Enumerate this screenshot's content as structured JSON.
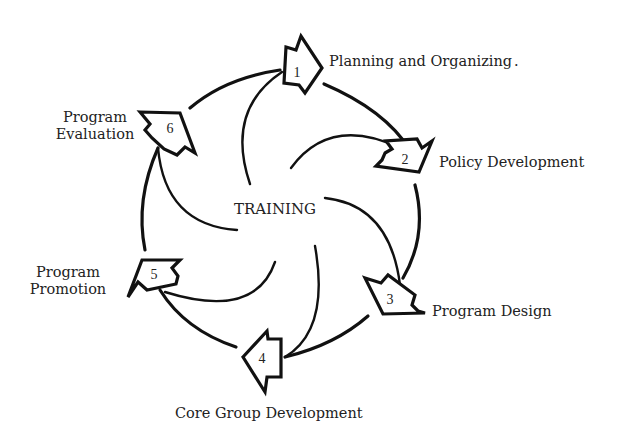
{
  "diagram": {
    "center_label": "TRAINING",
    "steps": [
      {
        "number": "1",
        "label": "Planning and Organizing",
        "label_suffix": "."
      },
      {
        "number": "2",
        "label": "Policy Development"
      },
      {
        "number": "3",
        "label": "Program Design"
      },
      {
        "number": "4",
        "label": "Core Group Development"
      },
      {
        "number": "5",
        "label_lines": [
          "Program",
          "Promotion"
        ]
      },
      {
        "number": "6",
        "label_lines": [
          "Program",
          "Evaluation"
        ]
      }
    ],
    "colors": {
      "stroke": "#111111",
      "background": "#ffffff",
      "text": "#222222"
    }
  }
}
